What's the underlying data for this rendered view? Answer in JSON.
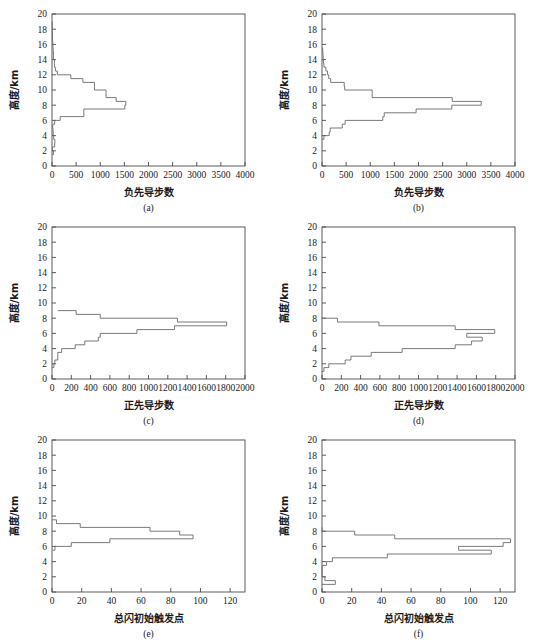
{
  "figure": {
    "title": "",
    "panel_count": 6,
    "axis": {
      "ylabel": "高度/km",
      "ylim": [
        0,
        20
      ],
      "yticks": [
        0,
        2,
        4,
        6,
        8,
        10,
        12,
        14,
        16,
        18,
        20
      ]
    }
  },
  "chart_data": [
    {
      "type": "bar",
      "orientation": "horizontal",
      "panel": "(a)",
      "title": "",
      "xlabel": "负先导步数",
      "ylabel": "高度/km",
      "xlim": [
        0,
        4000
      ],
      "ylim": [
        0,
        20
      ],
      "xticks": [
        0,
        500,
        1000,
        1500,
        2000,
        2500,
        3000,
        3500,
        4000
      ],
      "yticks": [
        0,
        2,
        4,
        6,
        8,
        10,
        12,
        14,
        16,
        18,
        20
      ],
      "grid": false,
      "legend": "none",
      "bin_edges": [
        1.5,
        2.0,
        2.5,
        3.0,
        3.5,
        4.0,
        4.5,
        5.0,
        5.5,
        6.0,
        6.5,
        7.0,
        7.5,
        8.0,
        8.5,
        9.0,
        9.5,
        10.0,
        10.5,
        11.0,
        11.5,
        12.0,
        12.5,
        13.0,
        13.5,
        14.0,
        14.5,
        15.0,
        15.5,
        16.0,
        16.5,
        17.0,
        17.5,
        18.0,
        18.5,
        19.0
      ],
      "values": [
        30,
        10,
        55,
        60,
        35,
        25,
        20,
        15,
        55,
        170,
        660,
        660,
        1510,
        1530,
        1330,
        1120,
        1120,
        880,
        880,
        640,
        390,
        110,
        70,
        50,
        50,
        30,
        30,
        25,
        20,
        15,
        10,
        10,
        8,
        6,
        5
      ]
    },
    {
      "type": "bar",
      "orientation": "horizontal",
      "panel": "(b)",
      "title": "",
      "xlabel": "负先导步数",
      "ylabel": "高度/km",
      "xlim": [
        0,
        4000
      ],
      "ylim": [
        0,
        20
      ],
      "xticks": [
        0,
        500,
        1000,
        1500,
        2000,
        2500,
        3000,
        3500,
        4000
      ],
      "yticks": [
        0,
        2,
        4,
        6,
        8,
        10,
        12,
        14,
        16,
        18,
        20
      ],
      "grid": false,
      "legend": "none",
      "bin_edges": [
        3.5,
        4.0,
        4.5,
        5.0,
        5.5,
        6.0,
        6.5,
        7.0,
        7.5,
        8.0,
        8.5,
        9.0,
        9.5,
        10.0,
        10.5,
        11.0,
        11.5,
        12.0,
        12.5,
        13.0,
        13.5,
        14.0,
        14.5,
        15.0,
        15.5
      ],
      "values": [
        40,
        150,
        170,
        420,
        480,
        1260,
        1290,
        1950,
        2690,
        3300,
        2700,
        1040,
        1040,
        470,
        460,
        180,
        140,
        115,
        80,
        40,
        30,
        25,
        20,
        15
      ]
    },
    {
      "type": "bar",
      "orientation": "horizontal",
      "panel": "(c)",
      "title": "",
      "xlabel": "正先导步数",
      "ylabel": "高度/km",
      "xlim": [
        0,
        2000
      ],
      "ylim": [
        0,
        20
      ],
      "xticks": [
        0,
        200,
        400,
        600,
        800,
        1000,
        1200,
        1400,
        1600,
        1800,
        2000
      ],
      "yticks": [
        0,
        2,
        4,
        6,
        8,
        10,
        12,
        14,
        16,
        18,
        20
      ],
      "grid": false,
      "legend": "none",
      "bin_edges": [
        1.5,
        2.0,
        2.5,
        3.0,
        3.5,
        4.0,
        4.5,
        5.0,
        5.5,
        6.0,
        6.5,
        7.0,
        7.5,
        8.0,
        8.5,
        9.0
      ],
      "values": [
        20,
        30,
        60,
        60,
        100,
        240,
        340,
        480,
        500,
        880,
        1270,
        1810,
        1300,
        500,
        250,
        60
      ]
    },
    {
      "type": "bar",
      "orientation": "horizontal",
      "panel": "(d)",
      "title": "",
      "xlabel": "正先导步数",
      "ylabel": "高度/km",
      "xlim": [
        0,
        2000
      ],
      "ylim": [
        0,
        20
      ],
      "xticks": [
        0,
        200,
        400,
        600,
        800,
        1000,
        1200,
        1400,
        1600,
        1800,
        2000
      ],
      "yticks": [
        0,
        2,
        4,
        6,
        8,
        10,
        12,
        14,
        16,
        18,
        20
      ],
      "grid": false,
      "legend": "none",
      "bin_edges": [
        1.0,
        1.5,
        2.0,
        2.5,
        3.0,
        3.5,
        4.0,
        4.5,
        5.0,
        5.5,
        6.0,
        6.5,
        7.0,
        7.5,
        8.0
      ],
      "values": [
        20,
        70,
        240,
        300,
        510,
        830,
        1380,
        1550,
        1660,
        1500,
        1790,
        1380,
        590,
        160
      ]
    },
    {
      "type": "bar",
      "orientation": "horizontal",
      "panel": "(e)",
      "title": "",
      "xlabel": "总闪初始触发点",
      "ylabel": "高度/km",
      "xlim": [
        0,
        130
      ],
      "ylim": [
        0,
        20
      ],
      "xticks": [
        0,
        20,
        40,
        60,
        80,
        100,
        120
      ],
      "yticks": [
        0,
        2,
        4,
        6,
        8,
        10,
        12,
        14,
        16,
        18,
        20
      ],
      "grid": false,
      "legend": "none",
      "bin_edges": [
        5.5,
        6.0,
        6.5,
        7.0,
        7.5,
        8.0,
        8.5,
        9.0,
        9.5
      ],
      "values": [
        2,
        13,
        39,
        95,
        86,
        66,
        19,
        3
      ]
    },
    {
      "type": "bar",
      "orientation": "horizontal",
      "panel": "(f)",
      "title": "",
      "xlabel": "总闪初始触发点",
      "ylabel": "高度/km",
      "xlim": [
        0,
        130
      ],
      "ylim": [
        0,
        20
      ],
      "xticks": [
        0,
        20,
        40,
        60,
        80,
        100,
        120
      ],
      "yticks": [
        0,
        2,
        4,
        6,
        8,
        10,
        12,
        14,
        16,
        18,
        20
      ],
      "grid": false,
      "legend": "none",
      "bin_edges": [
        1.0,
        1.5,
        2.0,
        3.5,
        4.0,
        4.5,
        5.0,
        5.5,
        6.0,
        6.5,
        7.0,
        7.5,
        8.0,
        8.5
      ],
      "values": [
        9,
        2,
        0,
        3,
        7,
        44,
        114,
        92,
        122,
        127,
        49,
        22,
        0
      ]
    }
  ],
  "panels": [
    {
      "id": "a",
      "letter": "(a)",
      "xlabel": "负先导步数",
      "ylabel": "高度/km"
    },
    {
      "id": "b",
      "letter": "(b)",
      "xlabel": "负先导步数",
      "ylabel": "高度/km"
    },
    {
      "id": "c",
      "letter": "(c)",
      "xlabel": "正先导步数",
      "ylabel": "高度/km"
    },
    {
      "id": "d",
      "letter": "(d)",
      "xlabel": "正先导步数",
      "ylabel": "高度/km"
    },
    {
      "id": "e",
      "letter": "(e)",
      "xlabel": "总闪初始触发点",
      "ylabel": "高度/km"
    },
    {
      "id": "f",
      "letter": "(f)",
      "xlabel": "总闪初始触发点",
      "ylabel": "高度/km"
    }
  ],
  "colors": {
    "background": "#ffffff",
    "axis": "#4a4a4a",
    "curve": "#6b6b6b",
    "text": "#1a1a1a"
  }
}
